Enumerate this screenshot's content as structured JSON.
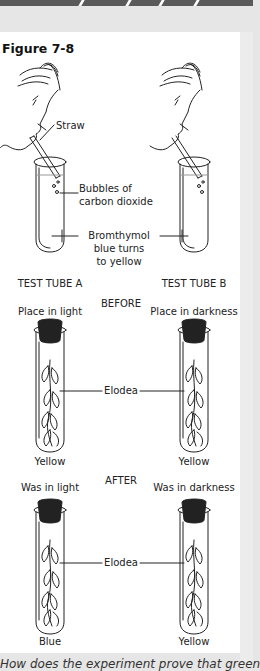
{
  "figure": {
    "title": "Figure 7-8",
    "labels": {
      "straw": "Straw",
      "bubbles": "Bubbles of carbon dioxide",
      "bubbles_line1": "Bubbles of",
      "bubbles_line2": "carbon dioxide",
      "bromthymol_line1": "Bromthymol",
      "bromthymol_line2": "blue turns",
      "bromthymol_line3": "to yellow",
      "elodea": "Elodea"
    },
    "test_tubes": [
      {
        "id": "A",
        "label": "TEST TUBE A",
        "before_condition": "Place in light",
        "before_color": "Yellow",
        "after_condition": "Was in light",
        "after_color": "Blue"
      },
      {
        "id": "B",
        "label": "TEST TUBE B",
        "before_condition": "Place in darkness",
        "before_color": "Yellow",
        "after_condition": "Was in darkness",
        "after_color": "Yellow"
      }
    ],
    "stages": {
      "before": "BEFORE",
      "after": "AFTER"
    }
  },
  "question": {
    "text": "How does the experiment prove that green"
  }
}
